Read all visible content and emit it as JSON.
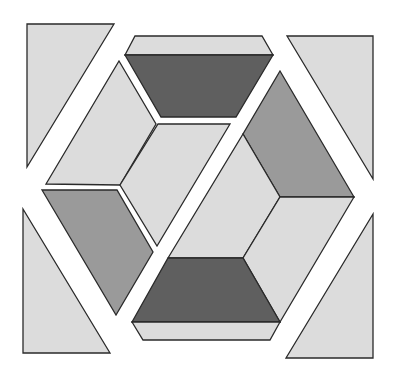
{
  "colors": {
    "background": "#ffffff",
    "light": "#dcdcdc",
    "medium": "#9a9a9a",
    "dark": "#5f5f5f",
    "outline": "#2a2a2a"
  },
  "pieces": [
    {
      "name": "top-left-triangle",
      "shade": "light",
      "points": "27,24 114,24 27,167"
    },
    {
      "name": "top-right-triangle",
      "shade": "light",
      "points": "287,36 373,36 373,179"
    },
    {
      "name": "bottom-left-triangle",
      "shade": "light",
      "points": "23,209 110,353 23,353"
    },
    {
      "name": "bottom-right-triangle",
      "shade": "light",
      "points": "373,214 373,358 286,358"
    },
    {
      "name": "top-light-strip",
      "shade": "light",
      "points": "135,36 262,36 273,55 125,55"
    },
    {
      "name": "top-dark-trapezoid",
      "shade": "dark",
      "points": "125,55 273,55 236,117 161,117"
    },
    {
      "name": "left-light-parallelogram",
      "shade": "light",
      "points": "119,61 156,124 120,185 46,184"
    },
    {
      "name": "center-upper-light-parallelogram",
      "shade": "light",
      "points": "158,124 230,124 157,246 120,185"
    },
    {
      "name": "left-medium-parallelogram",
      "shade": "medium",
      "points": "42,190 117,190 153,252 116,315"
    },
    {
      "name": "right-medium-parallelogram",
      "shade": "medium",
      "points": "280,71 354,197 280,197 243,134"
    },
    {
      "name": "center-lower-light-parallelogram",
      "shade": "light",
      "points": "243,134 280,197 243,258 168,258"
    },
    {
      "name": "right-light-parallelogram",
      "shade": "light",
      "points": "280,197 354,197 280,322 243,258"
    },
    {
      "name": "bottom-dark-trapezoid",
      "shade": "dark",
      "points": "168,258 243,258 280,322 132,322"
    },
    {
      "name": "bottom-light-strip",
      "shade": "light",
      "points": "132,322 280,322 270,340 143,340"
    }
  ]
}
